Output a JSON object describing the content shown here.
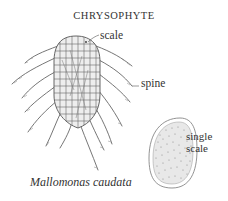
{
  "title": "CHRYSOPHYTE",
  "labels": {
    "scale": "scale",
    "spine": "spine",
    "single_scale_line1": "single",
    "single_scale_line2": "scale"
  },
  "species": "Mallomonas caudata",
  "colors": {
    "line": "#555555",
    "text": "#333333",
    "stipple": "#8a8a8a"
  }
}
